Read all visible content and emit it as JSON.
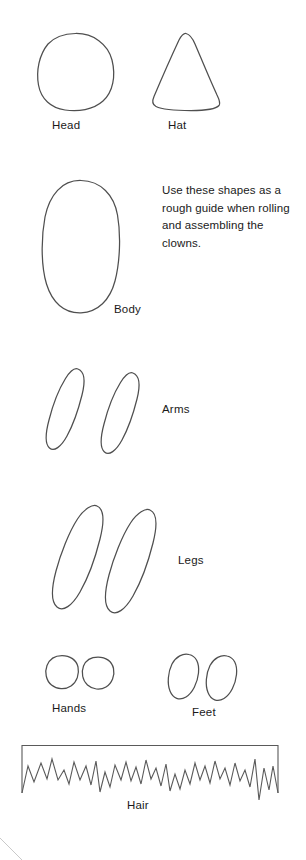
{
  "page": {
    "background_color": "#ffffff",
    "stroke_color": "#4f4f4f",
    "text_color": "#1a1a1a"
  },
  "instructions": {
    "text": "Use these shapes as a rough guide when rolling and assembling the clowns."
  },
  "shapes": [
    {
      "id": "head",
      "label": "Head",
      "form": "circle",
      "description": "hand-drawn circle",
      "bounds": {
        "x": 38,
        "y": 33,
        "width": 75,
        "height": 77
      }
    },
    {
      "id": "hat",
      "label": "Hat",
      "form": "cone",
      "description": "rounded triangular cone with curved base",
      "bounds": {
        "x": 152,
        "y": 33,
        "width": 68,
        "height": 77
      }
    },
    {
      "id": "body",
      "label": "Body",
      "form": "oval",
      "description": "large upright oval",
      "bounds": {
        "x": 43,
        "y": 180,
        "width": 76,
        "height": 133
      }
    },
    {
      "id": "arms",
      "label": "Arms",
      "form": "oval-pair",
      "description": "two tilted narrow ovals",
      "count": 2,
      "bounds": {
        "x": 44,
        "y": 368,
        "width": 104,
        "height": 86
      }
    },
    {
      "id": "legs",
      "label": "Legs",
      "form": "oval-pair",
      "description": "two tilted elongated ovals",
      "count": 2,
      "bounds": {
        "x": 46,
        "y": 505,
        "width": 116,
        "height": 110
      }
    },
    {
      "id": "hands",
      "label": "Hands",
      "form": "circle-pair",
      "description": "two small circles",
      "count": 2,
      "bounds": {
        "x": 44,
        "y": 655,
        "width": 70,
        "height": 40
      }
    },
    {
      "id": "feet",
      "label": "Feet",
      "form": "oval-pair",
      "description": "two small tilted ovals",
      "count": 2,
      "bounds": {
        "x": 168,
        "y": 654,
        "width": 72,
        "height": 46
      }
    },
    {
      "id": "hair",
      "label": "Hair",
      "form": "fringe-strip",
      "description": "rectangular strip with jagged zigzag fringe along bottom edge",
      "bounds": {
        "x": 22,
        "y": 745,
        "width": 256,
        "height": 48
      }
    }
  ]
}
